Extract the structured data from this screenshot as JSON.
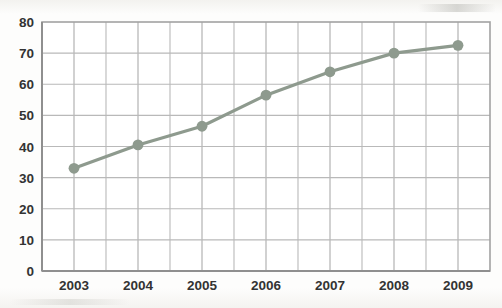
{
  "chart_data": {
    "type": "line",
    "title": "",
    "subtitle": "",
    "xlabel": "",
    "ylabel": "",
    "categories": [
      "2003",
      "2004",
      "2005",
      "2006",
      "2007",
      "2008",
      "2009"
    ],
    "x": [
      2003,
      2004,
      2005,
      2006,
      2007,
      2008,
      2009
    ],
    "values": [
      33,
      40.5,
      46.5,
      56.5,
      64,
      70,
      72.5
    ],
    "series": [
      {
        "name": "",
        "values": [
          33,
          40.5,
          46.5,
          56.5,
          64,
          70,
          72.5
        ]
      }
    ],
    "ylim": [
      0,
      80
    ],
    "ytick_labels": [
      "0",
      "10",
      "20",
      "30",
      "40",
      "50",
      "60",
      "70",
      "80"
    ],
    "yticks": [
      0,
      10,
      20,
      30,
      40,
      50,
      60,
      70,
      80
    ],
    "xtick_labels": [
      "2003",
      "2004",
      "2005",
      "2006",
      "2007",
      "2008",
      "2009"
    ],
    "grid": true,
    "grid_minor_vertical": true,
    "legend": "none",
    "marker": "circle",
    "colors": {
      "line": "#8e9a8e",
      "marker": "#8e9a8e",
      "grid": "#b9b9b9",
      "axis": "#9a9a9a",
      "text": "#333333",
      "background": "#fdfdfc"
    }
  }
}
